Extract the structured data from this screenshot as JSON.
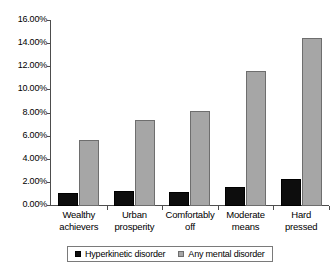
{
  "chart_data": {
    "type": "bar",
    "title": "",
    "subtitle": "",
    "xlabel": "",
    "ylabel": "",
    "ylim": [
      0,
      16
    ],
    "ytick_step": 2,
    "grid": false,
    "legend_position": "bottom",
    "value_format": "percent",
    "categories": [
      "Wealthy achievers",
      "Urban prosperity",
      "Comfortably off",
      "Moderate means",
      "Hard pressed"
    ],
    "category_lines": [
      [
        "Wealthy",
        "achievers"
      ],
      [
        "Urban",
        "prosperity"
      ],
      [
        "Comfortably",
        "off"
      ],
      [
        "Moderate",
        "means"
      ],
      [
        "Hard",
        "pressed"
      ]
    ],
    "ytick_labels": [
      "0.00%",
      "2.00%",
      "4.00%",
      "6.00%",
      "8.00%",
      "10.00%",
      "12.00%",
      "14.00%",
      "16.00%"
    ],
    "ytick_values": [
      0,
      2,
      4,
      6,
      8,
      10,
      12,
      14,
      16
    ],
    "series": [
      {
        "name": "Hyperkinetic disorder",
        "color": "#0d0d0d",
        "border_color": "#000000",
        "values": [
          1.1,
          1.3,
          1.2,
          1.65,
          2.3
        ]
      },
      {
        "name": "Any mental disorder",
        "color": "#a6a6a6",
        "border_color": "#6e6e6e",
        "values": [
          5.75,
          7.4,
          8.25,
          11.65,
          14.5
        ]
      }
    ]
  },
  "legend": {
    "items": [
      {
        "label": "Hyperkinetic disorder",
        "swatch": "black-square-swatch"
      },
      {
        "label": "Any mental disorder",
        "swatch": "grey-square-swatch"
      }
    ]
  }
}
